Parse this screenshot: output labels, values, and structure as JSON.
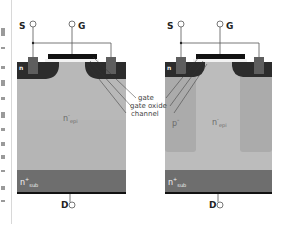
{
  "diagram": {
    "colors": {
      "n_epi": "#b7b7b7",
      "p_column": "#a9a9a9",
      "n_sub": "#6e6e6e",
      "p_body": "#2e2e2e",
      "n_plus_source": "#5c5c5c",
      "gate": "#111111",
      "gate_oxide": "#f2f2f2",
      "metal_line": "#555555",
      "drain_contact": "#111111"
    },
    "left_device": {
      "terminals": {
        "source": "S",
        "gate": "G",
        "drain": "D"
      },
      "labels": {
        "n_plus": "n",
        "epi_main": "n",
        "epi_sup": "-",
        "epi_sub": "epi",
        "sub_main": "n",
        "sub_sup": "+",
        "sub_sub": "sub"
      }
    },
    "right_device": {
      "terminals": {
        "source": "S",
        "gate": "G",
        "drain": "D"
      },
      "labels": {
        "n_plus": "n",
        "p_column": "p",
        "p_sup": "-",
        "epi_main": "n",
        "epi_sup": "-",
        "epi_sub": "epi",
        "sub_main": "n",
        "sub_sup": "+",
        "sub_sub": "sub"
      }
    },
    "callouts": [
      "gate",
      "gate oxide",
      "channel"
    ]
  }
}
